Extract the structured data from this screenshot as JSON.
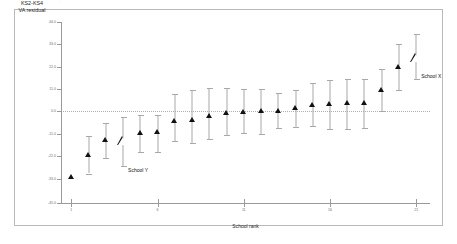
{
  "figure": {
    "top_artifact_text": "·",
    "background": "#ffffff",
    "frame_color": "#b9b9b9"
  },
  "chart_data": {
    "type": "scatter",
    "title": "",
    "subtitle": "",
    "xlabel": "School rank",
    "ylabel": "KS2-KS4 VA residual",
    "ylabel_lines": [
      "KS2-KS4",
      "VA residual"
    ],
    "xlim": [
      0.4,
      21.8
    ],
    "ylim": [
      -45.0,
      44.0
    ],
    "yticks": [
      44.0,
      33.0,
      22.0,
      11.0,
      0.0,
      -11.0,
      -22.0,
      -33.0,
      -45.0
    ],
    "ytick_labels": [
      "44.0",
      "33.0",
      "22.0",
      "11.0",
      "0.0",
      "-11.0",
      "-22.0",
      "-33.0",
      "-45.0"
    ],
    "xticks": [
      1,
      6,
      11,
      16,
      21
    ],
    "xtick_labels": [
      "1",
      "6",
      "11",
      "16",
      "21"
    ],
    "grid": false,
    "reference_line": {
      "y": 0.0,
      "style": "dotted",
      "color": "#b0b0b0"
    },
    "legend": "none",
    "error_bar_label": "95% confidence interval",
    "categories": [
      1,
      2,
      3,
      4,
      5,
      6,
      7,
      8,
      9,
      10,
      11,
      12,
      13,
      14,
      15,
      16,
      17,
      18,
      19,
      20,
      21
    ],
    "series": [
      {
        "name": "School VA residual",
        "marker": "triangle-filled",
        "color": "#111111",
        "values": [
          -32.0,
          -21.5,
          -14.0,
          -14.5,
          -10.5,
          -10.0,
          -4.5,
          -4.0,
          -2.0,
          -0.5,
          0.0,
          0.5,
          0.5,
          2.0,
          3.5,
          4.0,
          4.5,
          4.5,
          10.5,
          22.0,
          26.5
        ],
        "ci_low": [
          -32.0,
          -30.5,
          -23.0,
          -27.0,
          -20.0,
          -20.0,
          -14.5,
          -15.5,
          -13.5,
          -11.5,
          -10.5,
          -11.0,
          -8.0,
          -7.5,
          -7.0,
          -8.5,
          -8.5,
          -8.0,
          0.0,
          10.5,
          16.0
        ],
        "ci_high": [
          -32.0,
          -12.0,
          -5.5,
          -2.5,
          -1.5,
          -1.5,
          8.5,
          10.5,
          11.5,
          11.5,
          11.0,
          11.0,
          9.0,
          10.5,
          14.0,
          15.5,
          16.0,
          16.0,
          21.0,
          33.0,
          38.0
        ]
      }
    ],
    "highlights": [
      {
        "label": "School Y",
        "rank": 4,
        "value": -14.5,
        "ci_low": -27.0,
        "ci_high": -2.5,
        "marker": "triangle-open"
      },
      {
        "label": "School X",
        "rank": 21,
        "value": 26.5,
        "ci_low": 16.0,
        "ci_high": 38.0,
        "marker": "triangle-open"
      }
    ],
    "annotations": [
      {
        "text": "School Y",
        "rank": 4,
        "value": -29.0
      },
      {
        "text": "School X",
        "rank": 21,
        "value": 17.5
      }
    ]
  }
}
